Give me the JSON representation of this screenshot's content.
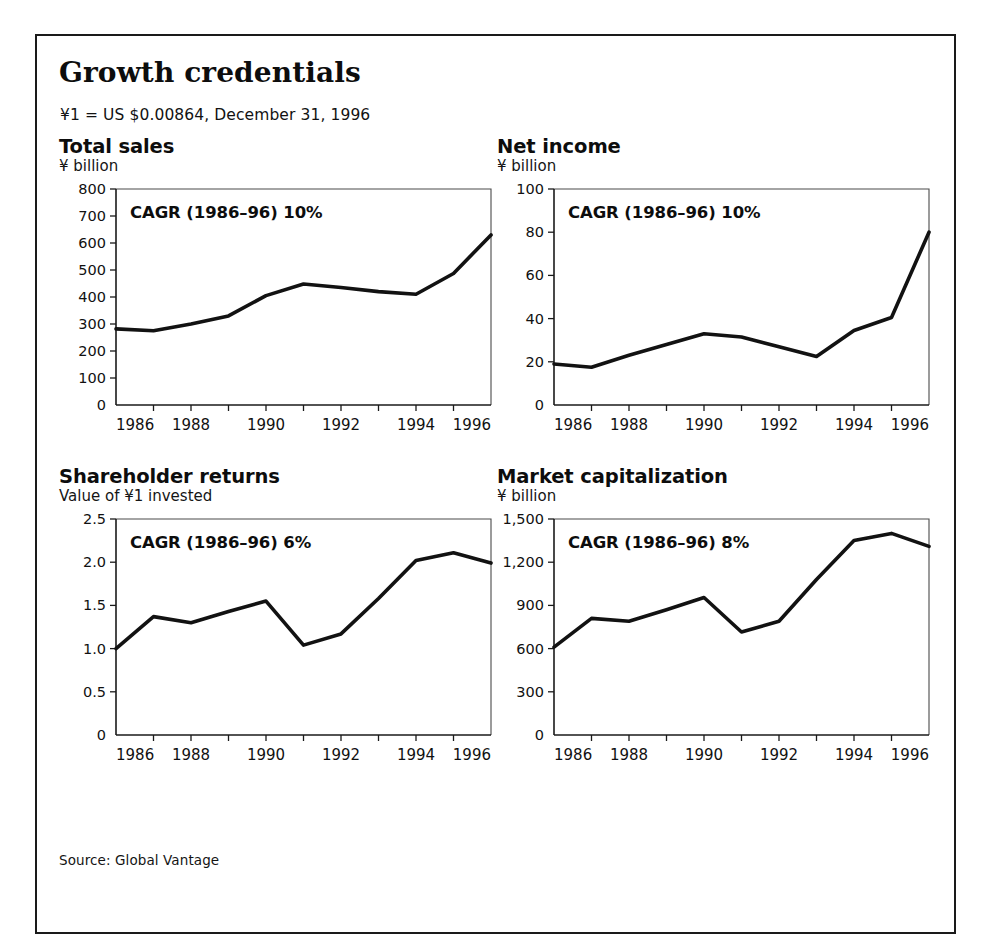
{
  "exhibit": {
    "title": "Growth credentials",
    "note": "¥1 = US $0.00864, December 31, 1996",
    "source": "Source: Global Vantage"
  },
  "panels": {
    "total_sales": {
      "title": "Total sales",
      "unit": "¥ billion",
      "cagr": "CAGR (1986–96) 10%"
    },
    "net_income": {
      "title": "Net income",
      "unit": "¥ billion",
      "cagr": "CAGR (1986–96) 10%"
    },
    "shareholder": {
      "title": "Shareholder returns",
      "unit": "Value of ¥1 invested",
      "cagr": "CAGR (1986–96) 6%"
    },
    "market_cap": {
      "title": "Market capitalization",
      "unit": "¥ billion",
      "cagr": "CAGR (1986–96) 8%"
    }
  },
  "chart_data": [
    {
      "id": "total_sales",
      "type": "line",
      "title": "Total sales",
      "subtitle": "¥ billion",
      "annotation": "CAGR (1986–96) 10%",
      "xlabel": "",
      "ylabel": "¥ billion",
      "x": [
        1986,
        1987,
        1988,
        1989,
        1990,
        1991,
        1992,
        1993,
        1994,
        1995,
        1996
      ],
      "values": [
        282,
        275,
        300,
        330,
        405,
        448,
        435,
        420,
        410,
        487,
        630
      ],
      "xlim": [
        1986,
        1996
      ],
      "ylim": [
        0,
        800
      ],
      "yticks": [
        0,
        100,
        200,
        300,
        400,
        500,
        600,
        700,
        800
      ],
      "ytick_labels": [
        "0",
        "100",
        "200",
        "300",
        "400",
        "500",
        "600",
        "700",
        "800"
      ],
      "xticks": [
        1986,
        1987,
        1988,
        1989,
        1990,
        1991,
        1992,
        1993,
        1994,
        1995,
        1996
      ],
      "xtick_labels": [
        "1986",
        "",
        "1988",
        "",
        "1990",
        "",
        "1992",
        "",
        "1994",
        "",
        "1996"
      ],
      "grid": false,
      "legend": "none"
    },
    {
      "id": "net_income",
      "type": "line",
      "title": "Net income",
      "subtitle": "¥ billion",
      "annotation": "CAGR (1986–96) 10%",
      "xlabel": "",
      "ylabel": "¥ billion",
      "x": [
        1986,
        1987,
        1988,
        1989,
        1990,
        1991,
        1992,
        1993,
        1994,
        1995,
        1996
      ],
      "values": [
        19,
        17.5,
        23,
        28,
        33,
        31.5,
        27,
        22.5,
        34.5,
        40.5,
        80
      ],
      "xlim": [
        1986,
        1996
      ],
      "ylim": [
        0,
        100
      ],
      "yticks": [
        0,
        20,
        40,
        60,
        80,
        100
      ],
      "ytick_labels": [
        "0",
        "20",
        "40",
        "60",
        "80",
        "100"
      ],
      "xticks": [
        1986,
        1987,
        1988,
        1989,
        1990,
        1991,
        1992,
        1993,
        1994,
        1995,
        1996
      ],
      "xtick_labels": [
        "1986",
        "",
        "1988",
        "",
        "1990",
        "",
        "1992",
        "",
        "1994",
        "",
        "1996"
      ],
      "grid": false,
      "legend": "none"
    },
    {
      "id": "shareholder",
      "type": "line",
      "title": "Shareholder returns",
      "subtitle": "Value of ¥1 invested",
      "annotation": "CAGR (1986–96) 6%",
      "xlabel": "",
      "ylabel": "Value of ¥1 invested",
      "x": [
        1986,
        1987,
        1988,
        1989,
        1990,
        1991,
        1992,
        1993,
        1994,
        1995,
        1996
      ],
      "values": [
        1.0,
        1.37,
        1.3,
        1.43,
        1.55,
        1.04,
        1.17,
        1.58,
        2.02,
        2.11,
        1.99
      ],
      "xlim": [
        1986,
        1996
      ],
      "ylim": [
        0,
        2.5
      ],
      "yticks": [
        0,
        0.5,
        1.0,
        1.5,
        2.0,
        2.5
      ],
      "ytick_labels": [
        "0",
        "0.5",
        "1.0",
        "1.5",
        "2.0",
        "2.5"
      ],
      "xticks": [
        1986,
        1987,
        1988,
        1989,
        1990,
        1991,
        1992,
        1993,
        1994,
        1995,
        1996
      ],
      "xtick_labels": [
        "1986",
        "",
        "1988",
        "",
        "1990",
        "",
        "1992",
        "",
        "1994",
        "",
        "1996"
      ],
      "grid": false,
      "legend": "none"
    },
    {
      "id": "market_cap",
      "type": "line",
      "title": "Market capitalization",
      "subtitle": "¥ billion",
      "annotation": "CAGR (1986–96) 8%",
      "xlabel": "",
      "ylabel": "¥ billion",
      "x": [
        1986,
        1987,
        1988,
        1989,
        1990,
        1991,
        1992,
        1993,
        1994,
        1995,
        1996
      ],
      "values": [
        610,
        810,
        790,
        870,
        955,
        715,
        790,
        1080,
        1350,
        1400,
        1310
      ],
      "xlim": [
        1986,
        1996
      ],
      "ylim": [
        0,
        1500
      ],
      "yticks": [
        0,
        300,
        600,
        900,
        1200,
        1500
      ],
      "ytick_labels": [
        "0",
        "300",
        "600",
        "900",
        "1,200",
        "1,500"
      ],
      "xticks": [
        1986,
        1987,
        1988,
        1989,
        1990,
        1991,
        1992,
        1993,
        1994,
        1995,
        1996
      ],
      "xtick_labels": [
        "1986",
        "",
        "1988",
        "",
        "1990",
        "",
        "1992",
        "",
        "1994",
        "",
        "1996"
      ],
      "grid": false,
      "legend": "none"
    }
  ]
}
